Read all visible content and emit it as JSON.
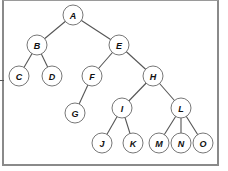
{
  "diagram": {
    "type": "tree",
    "root": "A",
    "nodes": [
      {
        "id": "A",
        "label": "A",
        "x": 73,
        "y": 15
      },
      {
        "id": "B",
        "label": "B",
        "x": 37,
        "y": 45
      },
      {
        "id": "E",
        "label": "E",
        "x": 119,
        "y": 45
      },
      {
        "id": "C",
        "label": "C",
        "x": 19,
        "y": 76
      },
      {
        "id": "D",
        "label": "D",
        "x": 52,
        "y": 76
      },
      {
        "id": "F",
        "label": "F",
        "x": 92,
        "y": 76
      },
      {
        "id": "H",
        "label": "H",
        "x": 153,
        "y": 76
      },
      {
        "id": "G",
        "label": "G",
        "x": 75,
        "y": 113
      },
      {
        "id": "I",
        "label": "I",
        "x": 122,
        "y": 108
      },
      {
        "id": "L",
        "label": "L",
        "x": 181,
        "y": 108
      },
      {
        "id": "J",
        "label": "J",
        "x": 102,
        "y": 143
      },
      {
        "id": "K",
        "label": "K",
        "x": 133,
        "y": 143
      },
      {
        "id": "M",
        "label": "M",
        "x": 159,
        "y": 143
      },
      {
        "id": "N",
        "label": "N",
        "x": 181,
        "y": 143
      },
      {
        "id": "O",
        "label": "O",
        "x": 203,
        "y": 143
      }
    ],
    "edges": [
      [
        "A",
        "B"
      ],
      [
        "A",
        "E"
      ],
      [
        "B",
        "C"
      ],
      [
        "B",
        "D"
      ],
      [
        "E",
        "F"
      ],
      [
        "E",
        "H"
      ],
      [
        "F",
        "G"
      ],
      [
        "H",
        "I"
      ],
      [
        "H",
        "L"
      ],
      [
        "I",
        "J"
      ],
      [
        "I",
        "K"
      ],
      [
        "L",
        "M"
      ],
      [
        "L",
        "N"
      ],
      [
        "L",
        "O"
      ]
    ],
    "node_radius": 10,
    "colors": {
      "node_fill": "#ffffff",
      "node_stroke": "#777777",
      "edge": "#555555",
      "label": "#111111",
      "frame": "#8a8a8a"
    }
  }
}
